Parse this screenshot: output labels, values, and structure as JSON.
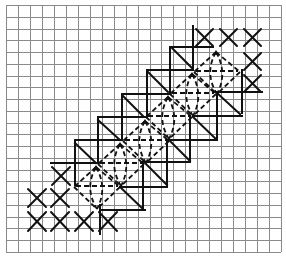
{
  "diagram": {
    "grid": {
      "columns": 23,
      "rows": 21,
      "origin_x": 6,
      "origin_y": 5,
      "cell_w": 11.96,
      "cell_h": 11.76,
      "line_color": "#8a8a8a"
    },
    "ink_color": "#111111",
    "cross_stitches": [
      {
        "x1": 196,
        "y1": 29,
        "x2": 213,
        "y2": 46
      },
      {
        "x1": 220,
        "y1": 29,
        "x2": 237,
        "y2": 46
      },
      {
        "x1": 244,
        "y1": 29,
        "x2": 261,
        "y2": 46
      },
      {
        "x1": 244,
        "y1": 53,
        "x2": 261,
        "y2": 70
      },
      {
        "x1": 244,
        "y1": 75,
        "x2": 261,
        "y2": 92
      },
      {
        "x1": 52,
        "y1": 167,
        "x2": 70,
        "y2": 185
      },
      {
        "x1": 28,
        "y1": 189,
        "x2": 46,
        "y2": 207
      },
      {
        "x1": 51,
        "y1": 189,
        "x2": 69,
        "y2": 207
      },
      {
        "x1": 28,
        "y1": 212,
        "x2": 46,
        "y2": 231
      },
      {
        "x1": 51,
        "y1": 212,
        "x2": 69,
        "y2": 231
      },
      {
        "x1": 75,
        "y1": 212,
        "x2": 93,
        "y2": 231
      },
      {
        "x1": 99,
        "y1": 212,
        "x2": 117,
        "y2": 231
      }
    ],
    "upper_steps": [
      {
        "vx": 193,
        "vy1": 26,
        "vy2": 70,
        "hy": 47,
        "hx1": 172,
        "hx2": 213
      },
      {
        "vx": 170,
        "vy1": 47,
        "vy2": 94,
        "hy": 70,
        "hx1": 147,
        "hx2": 193
      },
      {
        "vx": 147,
        "vy1": 70,
        "vy2": 117,
        "hy": 94,
        "hx1": 122,
        "hx2": 170
      },
      {
        "vx": 122,
        "vy1": 94,
        "vy2": 140,
        "hy": 117,
        "hx1": 98,
        "hx2": 147
      },
      {
        "vx": 98,
        "vy1": 117,
        "vy2": 163,
        "hy": 140,
        "hx1": 75,
        "hx2": 122
      },
      {
        "vx": 75,
        "vy1": 140,
        "vy2": 185,
        "hy": 163,
        "hx1": 51,
        "hx2": 98
      }
    ],
    "lower_steps": [
      {
        "vx": 242,
        "vy1": 70,
        "vy2": 113,
        "hy": 92,
        "hx1": 213,
        "hx2": 262
      },
      {
        "vx": 217,
        "vy1": 92,
        "vy2": 140,
        "hy": 116,
        "hx1": 193,
        "hx2": 242
      },
      {
        "vx": 190,
        "vy1": 116,
        "vy2": 162,
        "hy": 140,
        "hx1": 168,
        "hx2": 217
      },
      {
        "vx": 167,
        "vy1": 140,
        "vy2": 185,
        "hy": 162,
        "hx1": 145,
        "hx2": 190
      },
      {
        "vx": 143,
        "vy1": 162,
        "vy2": 210,
        "hy": 187,
        "hx1": 120,
        "hx2": 167
      },
      {
        "vx": 100,
        "vy1": 205,
        "vy2": 234,
        "hy": 210,
        "hx1": 100,
        "hx2": 145
      }
    ],
    "diagonals": [
      {
        "x1": 172,
        "y1": 48,
        "x2": 192,
        "y2": 68
      },
      {
        "x1": 148,
        "y1": 72,
        "x2": 168,
        "y2": 92
      },
      {
        "x1": 123,
        "y1": 96,
        "x2": 143,
        "y2": 116
      },
      {
        "x1": 98,
        "y1": 120,
        "x2": 120,
        "y2": 140
      },
      {
        "x1": 75,
        "y1": 143,
        "x2": 96,
        "y2": 163
      },
      {
        "x1": 217,
        "y1": 93,
        "x2": 240,
        "y2": 114
      },
      {
        "x1": 193,
        "y1": 117,
        "x2": 216,
        "y2": 139
      },
      {
        "x1": 170,
        "y1": 141,
        "x2": 190,
        "y2": 161
      },
      {
        "x1": 145,
        "y1": 163,
        "x2": 167,
        "y2": 185
      },
      {
        "x1": 120,
        "y1": 187,
        "x2": 142,
        "y2": 208
      }
    ],
    "dashed_motifs": [
      {
        "px": 216,
        "py": 52
      },
      {
        "px": 192,
        "py": 74
      },
      {
        "px": 168,
        "py": 97
      },
      {
        "px": 145,
        "py": 121
      },
      {
        "px": 120,
        "py": 144
      },
      {
        "px": 96,
        "py": 167
      }
    ]
  }
}
